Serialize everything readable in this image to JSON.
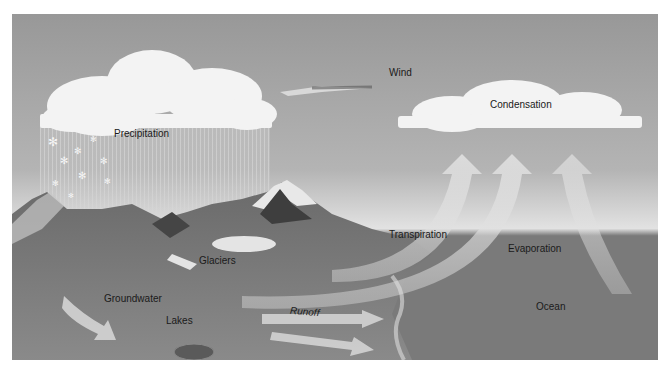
{
  "diagram": {
    "labels": {
      "wind": "Wind",
      "condensation": "Condensation",
      "precipitation": "Precipitation",
      "transpiration": "Transpiration",
      "evaporation": "Evaporation",
      "glaciers": "Glaciers",
      "groundwater": "Groundwater",
      "lakes": "Lakes",
      "runoff": "Runoff",
      "ocean": "Ocean"
    },
    "colors": {
      "sky_top": "#9a9a9a",
      "sky_horizon": "#dcdcdc",
      "ocean": "#7c7c7c",
      "land": "#6f6f6f",
      "cloud": "#f4f4f4",
      "arrow": "#d6d6d6"
    }
  }
}
